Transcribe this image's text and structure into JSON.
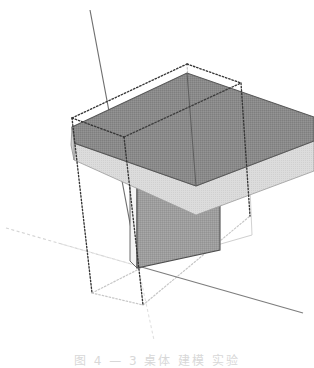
{
  "app": {
    "kind": "3d-modeling-viewport",
    "title": "3D model viewport",
    "background_color": "#ffffff"
  },
  "caption": {
    "text": "图 4 — 3 桌体 建模 实验",
    "color": "#b9b9b9",
    "note": "caption line cropped by page bottom edge"
  },
  "viewport": {
    "width": 314,
    "height": 340,
    "projection": "axonometric"
  },
  "axes": [
    {
      "name": "vertical-axis",
      "label": "blue-axis",
      "color": "#6b6b6b",
      "style": "solid",
      "x1": 90,
      "y1": 10,
      "x2": 138,
      "y2": 266
    },
    {
      "name": "depth-axis-positive",
      "label": "red-axis-positive",
      "color": "#7a7a7a",
      "style": "solid",
      "x1": 138,
      "y1": 266,
      "x2": 303,
      "y2": 313
    },
    {
      "name": "width-axis-negative",
      "label": "green-axis-negative",
      "color": "#d2d2d2",
      "style": "dashed",
      "x1": 6,
      "y1": 228,
      "x2": 138,
      "y2": 266
    },
    {
      "name": "vertical-axis-negative",
      "label": "blue-axis-negative",
      "color": "#dcdcdc",
      "style": "dashed",
      "x1": 138,
      "y1": 266,
      "x2": 152,
      "y2": 340
    },
    {
      "name": "depth-axis-negative",
      "label": "red-axis-negative",
      "color": "#dcdcdc",
      "style": "dashed",
      "x1": 138,
      "y1": 266,
      "x2": 60,
      "y2": 244
    }
  ],
  "geometry": {
    "tabletop": {
      "name": "tabletop",
      "top_face_color": "#888888",
      "front_edge_color": "#d9d9d9",
      "side_edge_color": "#c9c9c9",
      "outline_color": "#4a4a4a",
      "top_face_points": "72,128 187,73 314,118 314,140 196,185 74,144",
      "front_band_points": "74,144 196,185 314,140 314,170 196,214 74,160",
      "left_cap_points": "72,128 74,144 74,160 72,146"
    },
    "leg_panel": {
      "name": "leg-panel",
      "face_color": "#9a9a9a",
      "outline_color": "#4a4a4a",
      "points": "137,149 219,178 219,250 137,268",
      "inner_side_points": "131,140 137,149 137,268 131,262"
    },
    "leg_back_edge": {
      "name": "leg-back-edge-line",
      "color": "#b4b4b4",
      "x1": 219,
      "y1": 178,
      "x2": 248,
      "y2": 187
    },
    "floor_line": {
      "name": "floor-reference-line",
      "color": "#c8c8c8",
      "x1": 137,
      "y1": 268,
      "x2": 250,
      "y2": 236
    }
  },
  "selection_box": {
    "name": "selection-bounding-box",
    "style": "dotted",
    "color": "#3a3a3a",
    "faint_color": "#c0c0c0",
    "corners": {
      "top_front_left": [
        72,
        118
      ],
      "top_back_left": [
        187,
        64
      ],
      "top_back_right": [
        241,
        83
      ],
      "top_front_right": [
        240,
        84
      ],
      "bottom_front_left": [
        80,
        250
      ],
      "bottom_back_left": [
        196,
        196
      ],
      "bottom_back_right": [
        250,
        216
      ],
      "bottom_front_right": [
        143,
        305
      ]
    },
    "edges": [
      {
        "name": "bbox-edge-top-left-back",
        "x1": 72,
        "y1": 118,
        "x2": 187,
        "y2": 64,
        "tone": "dark"
      },
      {
        "name": "bbox-edge-top-back-right",
        "x1": 187,
        "y1": 64,
        "x2": 241,
        "y2": 83,
        "tone": "dark"
      },
      {
        "name": "bbox-edge-top-front",
        "x1": 72,
        "y1": 118,
        "x2": 124,
        "y2": 137,
        "tone": "dark"
      },
      {
        "name": "bbox-edge-top-front-b",
        "x1": 124,
        "y1": 137,
        "x2": 241,
        "y2": 83,
        "tone": "faint"
      },
      {
        "name": "bbox-edge-vert-left",
        "x1": 72,
        "y1": 118,
        "x2": 92,
        "y2": 293,
        "tone": "dark"
      },
      {
        "name": "bbox-edge-vert-mid",
        "x1": 124,
        "y1": 137,
        "x2": 143,
        "y2": 305,
        "tone": "dark"
      },
      {
        "name": "bbox-edge-vert-right",
        "x1": 241,
        "y1": 83,
        "x2": 250,
        "y2": 216,
        "tone": "dark"
      },
      {
        "name": "bbox-edge-vert-back",
        "x1": 187,
        "y1": 64,
        "x2": 196,
        "y2": 196,
        "tone": "faint"
      },
      {
        "name": "bbox-edge-bottom-left",
        "x1": 92,
        "y1": 293,
        "x2": 143,
        "y2": 305,
        "tone": "faint"
      },
      {
        "name": "bbox-edge-bottom-right",
        "x1": 143,
        "y1": 305,
        "x2": 250,
        "y2": 216,
        "tone": "faint"
      },
      {
        "name": "bbox-edge-bottom-back",
        "x1": 92,
        "y1": 293,
        "x2": 196,
        "y2": 240,
        "tone": "faint"
      }
    ]
  }
}
